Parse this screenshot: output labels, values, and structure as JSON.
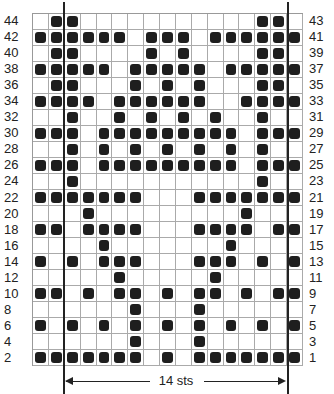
{
  "chart_data": {
    "type": "table",
    "title": "",
    "columns": 17,
    "rows": [
      {
        "left_label": "44",
        "right_label": "43",
        "filled": [
          2,
          3,
          15,
          16
        ]
      },
      {
        "left_label": "42",
        "right_label": "41",
        "filled": [
          1,
          2,
          3,
          4,
          5,
          6,
          8,
          9,
          10,
          12,
          13,
          14,
          15,
          16,
          17
        ]
      },
      {
        "left_label": "40",
        "right_label": "39",
        "filled": [
          2,
          3,
          8,
          10,
          15,
          16
        ]
      },
      {
        "left_label": "38",
        "right_label": "37",
        "filled": [
          1,
          2,
          3,
          4,
          5,
          7,
          8,
          9,
          10,
          11,
          13,
          14,
          15,
          16,
          17
        ]
      },
      {
        "left_label": "36",
        "right_label": "35",
        "filled": [
          2,
          3,
          7,
          9,
          11,
          15,
          16
        ]
      },
      {
        "left_label": "34",
        "right_label": "33",
        "filled": [
          1,
          2,
          3,
          4,
          6,
          7,
          8,
          9,
          10,
          11,
          14,
          15,
          16,
          17
        ]
      },
      {
        "left_label": "32",
        "right_label": "31",
        "filled": [
          3,
          6,
          8,
          10,
          12,
          15
        ]
      },
      {
        "left_label": "30",
        "right_label": "29",
        "filled": [
          1,
          2,
          3,
          5,
          6,
          7,
          8,
          9,
          10,
          11,
          12,
          13,
          15,
          16,
          17
        ]
      },
      {
        "left_label": "28",
        "right_label": "27",
        "filled": [
          3,
          5,
          7,
          9,
          11,
          13,
          15
        ]
      },
      {
        "left_label": "26",
        "right_label": "25",
        "filled": [
          1,
          2,
          3,
          5,
          6,
          7,
          8,
          9,
          10,
          11,
          12,
          13,
          15,
          16,
          17
        ]
      },
      {
        "left_label": "24",
        "right_label": "23",
        "filled": [
          3,
          15
        ]
      },
      {
        "left_label": "22",
        "right_label": "21",
        "filled": [
          1,
          2,
          3,
          4,
          5,
          6,
          7,
          11,
          12,
          13,
          14,
          15,
          16,
          17
        ]
      },
      {
        "left_label": "20",
        "right_label": "19",
        "filled": [
          4,
          14
        ]
      },
      {
        "left_label": "18",
        "right_label": "17",
        "filled": [
          1,
          2,
          4,
          5,
          6,
          7,
          11,
          12,
          13,
          14,
          16,
          17
        ]
      },
      {
        "left_label": "16",
        "right_label": "15",
        "filled": [
          5,
          13
        ]
      },
      {
        "left_label": "14",
        "right_label": "13",
        "filled": [
          1,
          3,
          5,
          6,
          7,
          11,
          12,
          13,
          15,
          17
        ]
      },
      {
        "left_label": "12",
        "right_label": "11",
        "filled": [
          6,
          12
        ]
      },
      {
        "left_label": "10",
        "right_label": "9",
        "filled": [
          1,
          2,
          4,
          6,
          7,
          9,
          11,
          12,
          14,
          16,
          17
        ]
      },
      {
        "left_label": "8",
        "right_label": "7",
        "filled": [
          7,
          11
        ]
      },
      {
        "left_label": "6",
        "right_label": "5",
        "filled": [
          1,
          3,
          5,
          7,
          9,
          11,
          13,
          15,
          17
        ]
      },
      {
        "left_label": "4",
        "right_label": "3",
        "filled": [
          7,
          11
        ]
      },
      {
        "left_label": "2",
        "right_label": "1",
        "filled": [
          1,
          2,
          3,
          4,
          5,
          6,
          7,
          9,
          11,
          12,
          13,
          14,
          15,
          16,
          17
        ]
      }
    ],
    "repeat": {
      "label": "14 sts",
      "start_col": 3,
      "end_col": 16
    },
    "colors": {
      "filled": "#1e1e1e",
      "empty": "#ffffff",
      "grid": "#aaaaaa"
    }
  },
  "annotation": {
    "repeat_label": "14 sts"
  }
}
